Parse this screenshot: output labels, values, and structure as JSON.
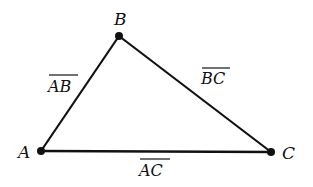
{
  "diagram": {
    "type": "triangle",
    "stroke_color": "#111111",
    "background": "#ffffff",
    "vertices": [
      {
        "id": "A",
        "label": "A",
        "x": 41,
        "y": 151
      },
      {
        "id": "B",
        "label": "B",
        "x": 119,
        "y": 36
      },
      {
        "id": "C",
        "label": "C",
        "x": 271,
        "y": 152
      }
    ],
    "segments": [
      {
        "id": "AB",
        "from": "A",
        "to": "B",
        "label": "AB",
        "overline": true
      },
      {
        "id": "BC",
        "from": "B",
        "to": "C",
        "label": "BC",
        "overline": true
      },
      {
        "id": "AC",
        "from": "A",
        "to": "C",
        "label": "AC",
        "overline": true
      }
    ]
  }
}
